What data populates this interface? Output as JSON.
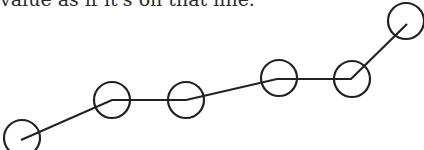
{
  "caption": {
    "text": "value as if it's on that line."
  },
  "diagram": {
    "stroke_color": "#222222",
    "line_width": 2.2,
    "circle_radius": 18,
    "points": [
      {
        "x": 21,
        "y": 140,
        "cx": 22,
        "cy": 138
      },
      {
        "x": 112,
        "y": 100,
        "cx": 112,
        "cy": 100
      },
      {
        "x": 186,
        "y": 100,
        "cx": 186,
        "cy": 100
      },
      {
        "x": 277,
        "y": 79,
        "cx": 279,
        "cy": 78
      },
      {
        "x": 351,
        "y": 79,
        "cx": 352,
        "cy": 79
      },
      {
        "x": 407,
        "y": 24,
        "cx": 406,
        "cy": 21
      }
    ]
  }
}
